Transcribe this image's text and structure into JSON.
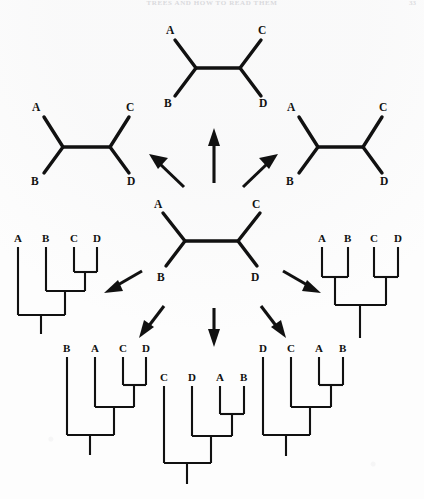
{
  "page": {
    "running_head": "TREES AND HOW TO READ THEM",
    "folio": "33",
    "background_color": "#fdfdfd",
    "ink_color": "#111111"
  },
  "figure": {
    "caption": "",
    "taxa": [
      "A",
      "B",
      "C",
      "D"
    ]
  },
  "unrooted_trees": [
    {
      "id": "unrooted-center",
      "position": "center",
      "tip_labels": {
        "top_left": "A",
        "top_right": "C",
        "bottom_left": "B",
        "bottom_right": "D"
      },
      "topology": "(A,B,(C,D))"
    },
    {
      "id": "unrooted-top",
      "position": "top",
      "tip_labels": {
        "top_left": "A",
        "top_right": "C",
        "bottom_left": "B",
        "bottom_right": "D"
      },
      "topology": "(A,B,(C,D))"
    },
    {
      "id": "unrooted-left",
      "position": "left",
      "tip_labels": {
        "top_left": "A",
        "top_right": "C",
        "bottom_left": "B",
        "bottom_right": "D"
      },
      "topology": "(A,B,(C,D))"
    },
    {
      "id": "unrooted-right",
      "position": "right",
      "tip_labels": {
        "top_left": "A",
        "top_right": "C",
        "bottom_left": "B",
        "bottom_right": "D"
      },
      "topology": "(A,B,(C,D))"
    }
  ],
  "rooted_trees": [
    {
      "id": "rooted-left",
      "position": "middle-left",
      "tip_labels": [
        "A",
        "B",
        "C",
        "D"
      ],
      "topology": "(A,(B,(C,D)))"
    },
    {
      "id": "rooted-right",
      "position": "middle-right",
      "tip_labels": [
        "A",
        "B",
        "C",
        "D"
      ],
      "topology": "((A,B),(C,D))"
    },
    {
      "id": "rooted-bottom-left",
      "position": "bottom-left",
      "tip_labels": [
        "B",
        "A",
        "C",
        "D"
      ],
      "topology": "(B,(A,(C,D)))"
    },
    {
      "id": "rooted-bottom-center",
      "position": "bottom-center",
      "tip_labels": [
        "C",
        "D",
        "A",
        "B"
      ],
      "topology": "(C,(D,(A,B)))"
    },
    {
      "id": "rooted-bottom-right",
      "position": "bottom-right",
      "tip_labels": [
        "D",
        "C",
        "A",
        "B"
      ],
      "topology": "(D,(C,(A,B)))"
    }
  ],
  "arrows": [
    {
      "id": "arrow-up",
      "direction": "up",
      "to": "unrooted-top"
    },
    {
      "id": "arrow-up-left",
      "direction": "up-left",
      "to": "unrooted-left"
    },
    {
      "id": "arrow-up-right",
      "direction": "up-right",
      "to": "unrooted-right"
    },
    {
      "id": "arrow-left",
      "direction": "down-left",
      "to": "rooted-left"
    },
    {
      "id": "arrow-right",
      "direction": "down-right",
      "to": "rooted-right"
    },
    {
      "id": "arrow-down-left",
      "direction": "down-left",
      "to": "rooted-bottom-left"
    },
    {
      "id": "arrow-down",
      "direction": "down",
      "to": "rooted-bottom-center"
    },
    {
      "id": "arrow-down-right",
      "direction": "down-right",
      "to": "rooted-bottom-right"
    }
  ]
}
